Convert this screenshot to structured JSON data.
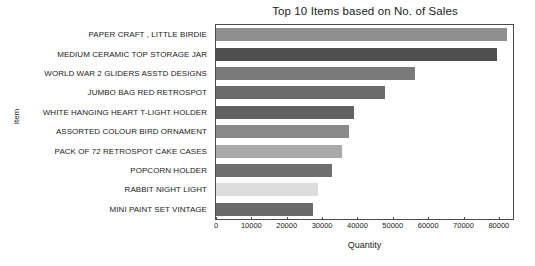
{
  "chart_data": {
    "type": "bar",
    "orientation": "horizontal",
    "title": "Top 10 Items based on No. of Sales",
    "xlabel": "Quantity",
    "ylabel": "Item",
    "xlim": [
      0,
      84000
    ],
    "ylim": null,
    "grid": false,
    "legend": null,
    "xticks": [
      0,
      10000,
      20000,
      30000,
      40000,
      50000,
      60000,
      70000,
      80000
    ],
    "xtick_labels": [
      "0",
      "10000",
      "20000",
      "30000",
      "40000",
      "50000",
      "60000",
      "70000",
      "80000"
    ],
    "categories": [
      "PAPER CRAFT , LITTLE BIRDIE",
      "MEDIUM CERAMIC TOP STORAGE JAR",
      "WORLD WAR 2 GLIDERS ASSTD DESIGNS",
      "JUMBO BAG RED RETROSPOT",
      "WHITE HANGING HEART T-LIGHT HOLDER",
      "ASSORTED COLOUR BIRD ORNAMENT",
      "PACK OF 72 RETROSPOT CAKE CASES",
      "POPCORN HOLDER",
      "RABBIT NIGHT LIGHT",
      "MINI PAINT SET VINTAGE"
    ],
    "values": [
      82200,
      79400,
      56200,
      47900,
      39000,
      37500,
      35500,
      32700,
      28900,
      27500
    ],
    "bar_colors": [
      "#8f8f8f",
      "#4f4f4f",
      "#7a7a7a",
      "#6b6b6b",
      "#616161",
      "#8a8a8a",
      "#a9a9a9",
      "#6e6e6e",
      "#dcdcdc",
      "#6a6a6a"
    ],
    "axis_color": "#4a4a4a",
    "background_color": "#ffffff",
    "text_color": "#222222"
  }
}
